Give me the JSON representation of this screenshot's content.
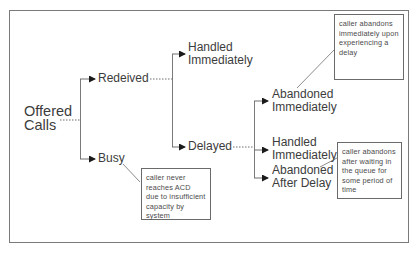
{
  "diagram": {
    "title": "",
    "root": {
      "label": "Offered Calls",
      "lines": [
        "Offered",
        "Calls"
      ]
    },
    "level1": [
      {
        "id": "received",
        "label": "Redeived"
      },
      {
        "id": "busy",
        "label": "Busy"
      }
    ],
    "level2": [
      {
        "id": "handled-immediately-1",
        "parent": "received",
        "lines": [
          "Handled",
          "Immediately"
        ]
      },
      {
        "id": "delayed",
        "parent": "received",
        "label": "Delayed"
      }
    ],
    "level3": [
      {
        "id": "abandoned-immediately",
        "parent": "delayed",
        "lines": [
          "Abandoned",
          "Immediately"
        ]
      },
      {
        "id": "handled-immediately-2",
        "parent": "delayed",
        "lines": [
          "Handled",
          "Immediately"
        ]
      },
      {
        "id": "abandoned-after-delay",
        "parent": "delayed",
        "lines": [
          "Abandoned",
          "After Delay"
        ]
      }
    ],
    "callouts": [
      {
        "id": "callout-abandoned-immediately",
        "target": "abandoned-immediately",
        "text": "caller abandons\nimmediately upon\nexperiencing a\ndelay"
      },
      {
        "id": "callout-busy",
        "target": "busy",
        "text": "caller never\nreaches ACD\ndue to insufficient\ncapacity by\nsystem"
      },
      {
        "id": "callout-abandoned-after-delay",
        "target": "abandoned-after-delay",
        "text": "caller abandons\nafter waiting in\nthe queue for\nsome period of\ntime"
      }
    ],
    "colors": {
      "line": "#6e6e6e",
      "arrow": "#1a1a1a",
      "text": "#3c3c3c",
      "frame": "#7a7a7a"
    }
  }
}
